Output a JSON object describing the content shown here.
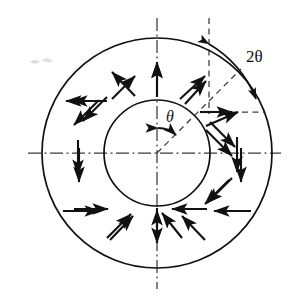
{
  "figure": {
    "type": "technical-line-diagram",
    "canvas": {
      "width": 293,
      "height": 298,
      "background": "#ffffff"
    },
    "stroke_color": "#111111",
    "center": {
      "x": 157,
      "y": 153
    },
    "circles": [
      {
        "name": "outer-circle",
        "radius": 115,
        "stroke_width": 1.6
      },
      {
        "name": "inner-circle",
        "radius": 53,
        "stroke_width": 1.6
      }
    ],
    "axes": {
      "horizontal_centerline": {
        "x1": 28,
        "x2": 281,
        "y": 153,
        "style": "dash-dot"
      },
      "vertical_centerline": {
        "x": 157,
        "y1": 18,
        "y2": 289,
        "style": "dash-dot"
      }
    },
    "reference_lines": [
      {
        "name": "vertical-dashed-reference",
        "x": 209,
        "y1": 18,
        "y2": 112,
        "style": "dashed"
      },
      {
        "name": "diagonal-dashed-radius",
        "from_center": true,
        "angle_deg": 45,
        "length": 118,
        "style": "dashed"
      },
      {
        "name": "horizontal-dashed-extension",
        "x1": 209,
        "x2": 262,
        "y": 112,
        "style": "dashed"
      }
    ],
    "angle_arcs": [
      {
        "name": "double-theta-arc",
        "label": "2θ",
        "label_position": {
          "x": 248,
          "y": 58
        },
        "radius": 112,
        "start_angle_deg": 90,
        "end_angle_deg": 45,
        "arrowheads": "both"
      },
      {
        "name": "theta-arc",
        "label": "θ",
        "label_position": {
          "x": 168,
          "y": 119
        },
        "radius": 26,
        "start_angle_deg": 90,
        "end_angle_deg": 45,
        "arrowheads": "both"
      }
    ],
    "arrow_field": {
      "name": "radial-arrow-field",
      "count": 12,
      "spacing_deg": 30,
      "description": "Twelve arrows spaced 30 degrees apart in the annulus, alternating between outward-pointing and inward-pointing directions",
      "arrows": [
        {
          "index": 0,
          "angle_deg": 90,
          "direction": "outward"
        },
        {
          "index": 1,
          "angle_deg": 60,
          "direction": "outward"
        },
        {
          "index": 2,
          "angle_deg": 30,
          "direction": "outward"
        },
        {
          "index": 3,
          "angle_deg": 0,
          "direction": "inward"
        },
        {
          "index": 4,
          "angle_deg": 330,
          "direction": "inward"
        },
        {
          "index": 5,
          "angle_deg": 300,
          "direction": "inward"
        },
        {
          "index": 6,
          "angle_deg": 270,
          "direction": "inward"
        },
        {
          "index": 7,
          "angle_deg": 240,
          "direction": "inward"
        },
        {
          "index": 8,
          "angle_deg": 210,
          "direction": "inward"
        },
        {
          "index": 9,
          "angle_deg": 180,
          "direction": "outward"
        },
        {
          "index": 10,
          "angle_deg": 150,
          "direction": "outward"
        },
        {
          "index": 11,
          "angle_deg": 120,
          "direction": "outward"
        }
      ]
    },
    "labels": {
      "double_theta": "2θ",
      "theta": "θ"
    },
    "artifact": {
      "name": "scan-speck",
      "position": {
        "x": 38,
        "y": 62
      },
      "visible": true
    }
  }
}
